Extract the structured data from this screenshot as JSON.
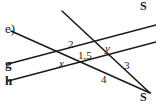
{
  "figure": {
    "problem_label": "e)",
    "background_color": "#ffffff",
    "stroke_color": "#1a1a1a",
    "width": 156,
    "height": 105
  },
  "line_labels": [
    {
      "id": "g",
      "text": "g",
      "x": 5,
      "y": 57
    },
    {
      "id": "h",
      "text": "h",
      "x": 5,
      "y": 74
    }
  ],
  "point_labels": [
    {
      "id": "s-top",
      "text": "S",
      "x": 140,
      "y": 0
    },
    {
      "id": "s-bottom",
      "text": "S",
      "x": 140,
      "y": 91
    }
  ],
  "angle_labels": [
    {
      "id": "angle-2",
      "text": "2",
      "x": 68,
      "y": 39
    },
    {
      "id": "angle-1-5",
      "text": "1,5",
      "x": 78,
      "y": 50
    },
    {
      "id": "angle-3",
      "text": "3",
      "x": 124,
      "y": 60
    },
    {
      "id": "angle-4",
      "text": "4",
      "x": 101,
      "y": 74
    }
  ],
  "variable_labels": [
    {
      "id": "angle-x",
      "text": "x",
      "x": 59,
      "y": 58
    },
    {
      "id": "angle-y",
      "text": "y",
      "x": 105,
      "y": 43
    }
  ],
  "lines": [
    {
      "id": "line-g",
      "name": "parallel-line-g",
      "x1": 8,
      "y1": 64,
      "x2": 156,
      "y2": 25
    },
    {
      "id": "line-h",
      "name": "parallel-line-h",
      "x1": 8,
      "y1": 81,
      "x2": 156,
      "y2": 42
    },
    {
      "id": "transversal-upper",
      "name": "transversal-from-upper-left-to-s-bottom",
      "x1": 62,
      "y1": 11,
      "x2": 150,
      "y2": 93
    },
    {
      "id": "transversal-lower",
      "name": "transversal-from-lower-left-to-s-bottom",
      "x1": 11,
      "y1": 31,
      "x2": 150,
      "y2": 93
    }
  ]
}
